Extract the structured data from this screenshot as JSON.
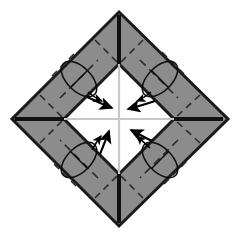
{
  "figure": {
    "type": "origami-instruction-diagram",
    "canvas": {
      "width": 240,
      "height": 238,
      "background": "#ffffff"
    },
    "colors": {
      "paper_front": "#8c8c8c",
      "paper_back": "#ffffff",
      "outline": "#1a1a1a",
      "crease_dashed": "#2b2b2b",
      "center_guide": "#c8c8c8",
      "arrow": "#000000"
    }
  },
  "shapes": {
    "outer_diamond": {
      "name": "folded-paper-outline",
      "points": "119,12 228,119 119,226 12,119",
      "fill": "#8c8c8c",
      "stroke": "#1a1a1a",
      "stroke_width": 3
    },
    "inner_diamond": {
      "name": "inner-white-square",
      "points": "119,64 174,119 119,174 64,119",
      "fill": "#ffffff",
      "stroke": "#1a1a1a",
      "stroke_width": 3
    }
  },
  "center_guides": [
    {
      "name": "vertical-center-line",
      "x1": 119,
      "y1": 64,
      "x2": 119,
      "y2": 174
    },
    {
      "name": "horizontal-center-line",
      "x1": 64,
      "y1": 119,
      "x2": 174,
      "y2": 119
    }
  ],
  "corner_creases": [
    {
      "name": "crease-top-vertical",
      "x1": 119,
      "y1": 14,
      "x2": 119,
      "y2": 64
    },
    {
      "name": "crease-bottom-vertical",
      "x1": 119,
      "y1": 174,
      "x2": 119,
      "y2": 224
    },
    {
      "name": "crease-left-horizontal",
      "x1": 14,
      "y1": 119,
      "x2": 64,
      "y2": 119
    },
    {
      "name": "crease-right-horizontal",
      "x1": 174,
      "y1": 119,
      "x2": 226,
      "y2": 119
    }
  ],
  "dashed_creases": {
    "along_band": [
      {
        "name": "dash-band-top-left",
        "x1": 66,
        "y1": 92,
        "x2": 92,
        "y2": 66
      },
      {
        "name": "dash-band-top-right",
        "x1": 146,
        "y1": 66,
        "x2": 172,
        "y2": 92
      },
      {
        "name": "dash-band-bottom-right",
        "x1": 172,
        "y1": 146,
        "x2": 146,
        "y2": 172
      },
      {
        "name": "dash-band-bottom-left",
        "x1": 92,
        "y1": 172,
        "x2": 66,
        "y2": 146
      }
    ],
    "across_band": [
      {
        "name": "dash-cross-tl-outer",
        "x1": 58,
        "y1": 82,
        "x2": 82,
        "y2": 58
      },
      {
        "name": "dash-cross-tl-inner",
        "x1": 76,
        "y1": 100,
        "x2": 100,
        "y2": 76
      },
      {
        "name": "dash-cross-tr-outer",
        "x1": 156,
        "y1": 58,
        "x2": 180,
        "y2": 82
      },
      {
        "name": "dash-cross-tr-inner",
        "x1": 138,
        "y1": 76,
        "x2": 162,
        "y2": 100
      },
      {
        "name": "dash-cross-br-outer",
        "x1": 180,
        "y1": 156,
        "x2": 156,
        "y2": 180
      },
      {
        "name": "dash-cross-br-inner",
        "x1": 162,
        "y1": 138,
        "x2": 138,
        "y2": 162
      },
      {
        "name": "dash-cross-bl-outer",
        "x1": 82,
        "y1": 180,
        "x2": 58,
        "y2": 156
      },
      {
        "name": "dash-cross-bl-inner",
        "x1": 100,
        "y1": 162,
        "x2": 76,
        "y2": 138
      }
    ],
    "corner_diagonals": [
      {
        "name": "dash-corner-top",
        "x1": 95,
        "y1": 40,
        "x2": 119,
        "y2": 64
      },
      {
        "name": "dash-corner-top-b",
        "x1": 143,
        "y1": 40,
        "x2": 119,
        "y2": 64
      },
      {
        "name": "dash-corner-left",
        "x1": 40,
        "y1": 95,
        "x2": 64,
        "y2": 119
      },
      {
        "name": "dash-corner-left-b",
        "x1": 40,
        "y1": 143,
        "x2": 64,
        "y2": 119
      },
      {
        "name": "dash-corner-right",
        "x1": 200,
        "y1": 95,
        "x2": 174,
        "y2": 119
      },
      {
        "name": "dash-corner-right-b",
        "x1": 200,
        "y1": 143,
        "x2": 174,
        "y2": 119
      },
      {
        "name": "dash-corner-bottom",
        "x1": 95,
        "y1": 198,
        "x2": 119,
        "y2": 174
      },
      {
        "name": "dash-corner-bottom-b",
        "x1": 143,
        "y1": 198,
        "x2": 119,
        "y2": 174
      }
    ]
  },
  "curl_arrows": [
    {
      "name": "curl-arrow-top-left",
      "label": "rotate fold top-left band",
      "ellipse": {
        "cx": 79,
        "cy": 79,
        "rx": 12,
        "ry": 22,
        "rotate": -45
      }
    },
    {
      "name": "curl-arrow-top-right",
      "label": "rotate fold top-right band",
      "ellipse": {
        "cx": 160,
        "cy": 79,
        "rx": 12,
        "ry": 22,
        "rotate": 45
      }
    },
    {
      "name": "curl-arrow-bottom-left",
      "label": "rotate fold bottom-left band",
      "ellipse": {
        "cx": 79,
        "cy": 160,
        "rx": 12,
        "ry": 22,
        "rotate": 45
      }
    },
    {
      "name": "curl-arrow-bottom-right",
      "label": "rotate fold bottom-right band",
      "ellipse": {
        "cx": 160,
        "cy": 160,
        "rx": 12,
        "ry": 22,
        "rotate": -45
      }
    }
  ],
  "fold_arrows": [
    {
      "name": "fold-arrow-top-left",
      "label": "fold inward from top-left",
      "direction": "down-right",
      "path": "M 87,97 C 96,101 104,105 113,108"
    },
    {
      "name": "fold-arrow-top-right",
      "label": "fold inward from top-right",
      "direction": "down-left",
      "path": "M 155,101 C 146,104 136,107 128,109"
    },
    {
      "name": "fold-arrow-bottom-left",
      "label": "fold inward from bottom-left",
      "direction": "up-right",
      "path": "M 100,154 C 104,144 107,137 109,130"
    },
    {
      "name": "fold-arrow-bottom-right",
      "label": "fold inward from bottom-right",
      "direction": "up-left",
      "path": "M 152,141 C 144,137 137,133 130,129"
    }
  ]
}
